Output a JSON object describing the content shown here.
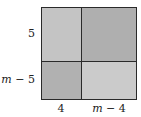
{
  "diagram": {
    "type": "area-model",
    "rows": [
      {
        "label": "5",
        "label_var": "",
        "label_rest": "5"
      },
      {
        "label": "m − 5",
        "label_var": "m",
        "label_rest": " − 5"
      }
    ],
    "columns": [
      {
        "label": "4",
        "label_var": "",
        "label_rest": "4"
      },
      {
        "label": "m − 4",
        "label_var": "m",
        "label_rest": " − 4"
      }
    ],
    "cells": [
      {
        "row": 0,
        "col": 0,
        "fill": "#c4c4c4"
      },
      {
        "row": 0,
        "col": 1,
        "fill": "#afafaf"
      },
      {
        "row": 1,
        "col": 0,
        "fill": "#b1b1b1"
      },
      {
        "row": 1,
        "col": 1,
        "fill": "#cbcbcb"
      }
    ],
    "border_color": "#2a2a2a"
  }
}
